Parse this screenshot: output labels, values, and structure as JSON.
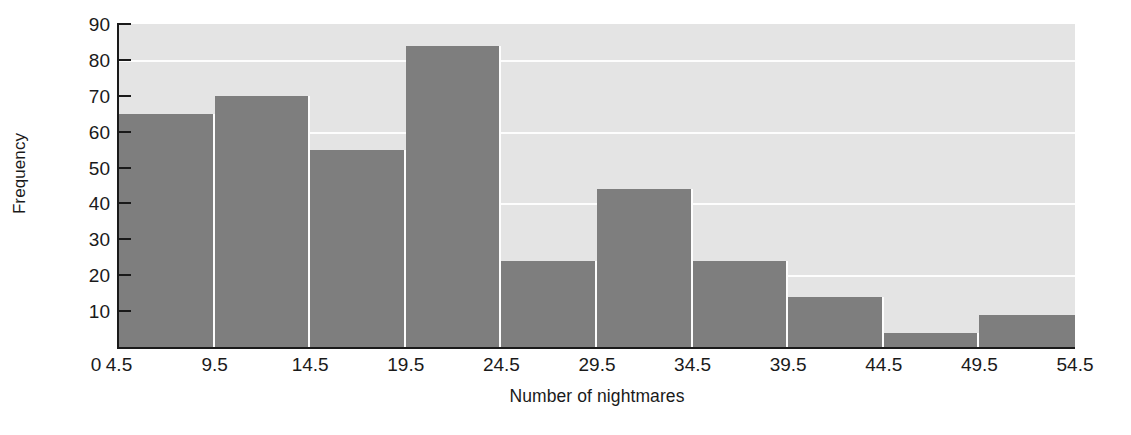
{
  "chart_data": {
    "type": "bar",
    "title": "",
    "xlabel": "Number of nightmares",
    "ylabel": "Frequency",
    "categories": [
      "4.5-9.5",
      "9.5-14.5",
      "14.5-19.5",
      "19.5-24.5",
      "24.5-29.5",
      "29.5-34.5",
      "34.5-39.5",
      "39.5-44.5",
      "44.5-49.5",
      "49.5-54.5"
    ],
    "bin_edges": [
      4.5,
      9.5,
      14.5,
      19.5,
      24.5,
      29.5,
      34.5,
      39.5,
      44.5,
      49.5,
      54.5
    ],
    "values": [
      65,
      70,
      55,
      84,
      24,
      44,
      24,
      14,
      4,
      9
    ],
    "xlim": [
      4.5,
      54.5
    ],
    "ylim": [
      0,
      90
    ],
    "x_tick_labels": [
      "0",
      "4.5",
      "9.5",
      "14.5",
      "19.5",
      "24.5",
      "29.5",
      "34.5",
      "39.5",
      "44.5",
      "49.5",
      "54.5"
    ],
    "x_tick_values": [
      0,
      4.5,
      9.5,
      14.5,
      19.5,
      24.5,
      29.5,
      34.5,
      39.5,
      44.5,
      49.5,
      54.5
    ],
    "y_tick_labels": [
      "10",
      "20",
      "30",
      "40",
      "50",
      "60",
      "70",
      "80",
      "90"
    ],
    "y_tick_values": [
      10,
      20,
      30,
      40,
      50,
      60,
      70,
      80,
      90
    ],
    "gridlines_y": [
      20,
      40,
      60,
      80
    ],
    "grid": true,
    "legend": "none",
    "colors": {
      "bar_fill": "#7e7e7e",
      "plot_background": "#e4e4e4",
      "gridline": "#fdfdfd",
      "axis": "#1a1a1a",
      "text": "#1a1a1a",
      "figure_background": "#ffffff"
    }
  }
}
